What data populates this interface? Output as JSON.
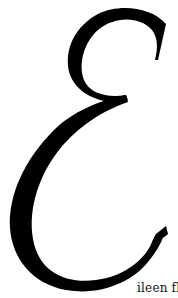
{
  "logo": {
    "letter": "E",
    "trailing_text": "ileen fle",
    "ink_color": "#000000",
    "background_color": "#ffffff"
  }
}
